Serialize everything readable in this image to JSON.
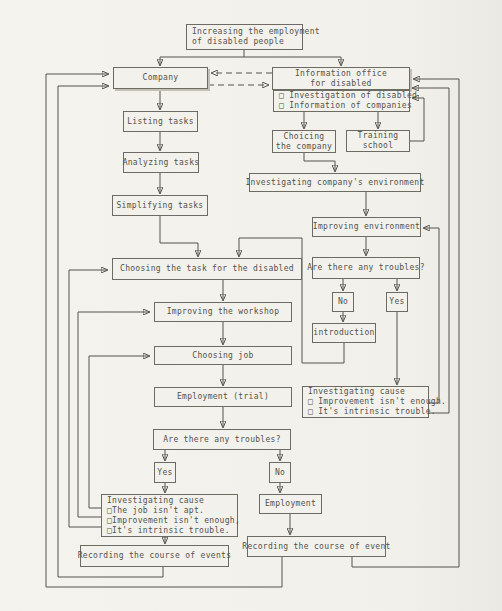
{
  "colors": {
    "paper": "#f2f1ec",
    "ink": "#53514b",
    "line": "#55534c"
  },
  "diagram": {
    "title_node": "goal",
    "nodes": {
      "goal": [
        "Increasing the employment",
        "of disabled people"
      ],
      "company": [
        "Company"
      ],
      "info_office": [
        "Information office",
        "for disabled"
      ],
      "services": [
        "□ Investigation of disabled",
        "□ Information of companies"
      ],
      "listing": [
        "Listing tasks"
      ],
      "analyzing": [
        "Analyzing tasks"
      ],
      "simplifying": [
        "Simplifying tasks"
      ],
      "choicing": [
        "Choicing",
        "the company"
      ],
      "training": [
        "Training",
        "school"
      ],
      "invest_env": [
        "Investigating company's environment"
      ],
      "improve_env": [
        "Improving environment"
      ],
      "troubles_right": [
        "Are there any troubles?"
      ],
      "no_right": [
        "No"
      ],
      "yes_right": [
        "Yes"
      ],
      "introduction": [
        "introduction"
      ],
      "cause_right": [
        "Investigating cause",
        "□ Improvement isn't enough.",
        "□ It's intrinsic trouble."
      ],
      "choosing_task": [
        "Choosing the task for the disabled"
      ],
      "improve_workshop": [
        "Improving the workshop"
      ],
      "choosing_job": [
        "Choosing job"
      ],
      "employment_trial": [
        "Employment (trial)"
      ],
      "troubles_left": [
        "Are there any troubles?"
      ],
      "yes_left": [
        "Yes"
      ],
      "no_left": [
        "No"
      ],
      "cause_left": [
        "Investigating cause",
        "□The job isn't apt.",
        "□Improvement isn't enough,",
        "□It's intrinsic trouble."
      ],
      "recording_events": [
        "Recording the course of events"
      ],
      "employment": [
        "Employment"
      ],
      "recording_event": [
        "Recording the course of event"
      ]
    },
    "edges": [
      {
        "from": "goal",
        "to": "company",
        "style": "solid"
      },
      {
        "from": "goal",
        "to": "info_office",
        "style": "solid"
      },
      {
        "from": "info_office",
        "to": "company",
        "style": "dashed"
      },
      {
        "from": "company",
        "to": "info_office",
        "style": "dashed"
      },
      {
        "from": "company",
        "to": "listing",
        "style": "solid"
      },
      {
        "from": "listing",
        "to": "analyzing",
        "style": "solid"
      },
      {
        "from": "analyzing",
        "to": "simplifying",
        "style": "solid"
      },
      {
        "from": "simplifying",
        "to": "choosing_task",
        "style": "solid"
      },
      {
        "from": "services",
        "to": "choicing",
        "style": "solid"
      },
      {
        "from": "services",
        "to": "training",
        "style": "solid"
      },
      {
        "from": "training",
        "to": "services",
        "style": "solid"
      },
      {
        "from": "choicing",
        "to": "invest_env",
        "style": "solid"
      },
      {
        "from": "invest_env",
        "to": "improve_env",
        "style": "solid"
      },
      {
        "from": "improve_env",
        "to": "troubles_right",
        "style": "solid"
      },
      {
        "from": "troubles_right",
        "to": "no_right",
        "style": "solid"
      },
      {
        "from": "troubles_right",
        "to": "yes_right",
        "style": "solid"
      },
      {
        "from": "no_right",
        "to": "introduction",
        "style": "solid"
      },
      {
        "from": "introduction",
        "to": "choosing_task",
        "style": "solid"
      },
      {
        "from": "yes_right",
        "to": "cause_right",
        "style": "solid"
      },
      {
        "from": "cause_right",
        "to": "improve_env",
        "style": "solid"
      },
      {
        "from": "cause_right",
        "to": "info_office",
        "style": "solid"
      },
      {
        "from": "choosing_task",
        "to": "improve_workshop",
        "style": "solid"
      },
      {
        "from": "improve_workshop",
        "to": "choosing_job",
        "style": "solid"
      },
      {
        "from": "choosing_job",
        "to": "employment_trial",
        "style": "solid"
      },
      {
        "from": "employment_trial",
        "to": "troubles_left",
        "style": "solid"
      },
      {
        "from": "troubles_left",
        "to": "yes_left",
        "style": "solid"
      },
      {
        "from": "troubles_left",
        "to": "no_left",
        "style": "solid"
      },
      {
        "from": "yes_left",
        "to": "cause_left",
        "style": "solid"
      },
      {
        "from": "cause_left",
        "to": "recording_events",
        "style": "solid"
      },
      {
        "from": "cause_left",
        "to": "choosing_job",
        "style": "solid"
      },
      {
        "from": "cause_left",
        "to": "improve_workshop",
        "style": "solid"
      },
      {
        "from": "cause_left",
        "to": "choosing_task",
        "style": "solid"
      },
      {
        "from": "no_left",
        "to": "employment",
        "style": "solid"
      },
      {
        "from": "employment",
        "to": "recording_event",
        "style": "solid"
      },
      {
        "from": "recording_events",
        "to": "company",
        "style": "solid"
      },
      {
        "from": "recording_event",
        "to": "company",
        "style": "solid"
      },
      {
        "from": "recording_event",
        "to": "info_office",
        "style": "solid"
      }
    ]
  }
}
